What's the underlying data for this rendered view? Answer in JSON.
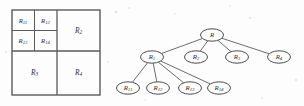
{
  "figure": {
    "background_color": "#fdfdfd",
    "line_color": "#5a5a5a",
    "text_color": "#2e2e2e"
  },
  "partition_diagram": {
    "name": "rectangle-partition",
    "outer": {
      "x": 12,
      "y": 10,
      "w": 88,
      "h": 85
    },
    "split_x": 57,
    "split_y": 51,
    "sub_split_x": 34.5,
    "sub_split_y": 30.5,
    "regions": [
      {
        "id": "R11",
        "base": "R",
        "sub": "11",
        "cx": 23,
        "cy": 20.5
      },
      {
        "id": "R12",
        "base": "R",
        "sub": "12",
        "cx": 45.5,
        "cy": 20.5
      },
      {
        "id": "R13",
        "base": "R",
        "sub": "13",
        "cx": 23,
        "cy": 41
      },
      {
        "id": "R14",
        "base": "R",
        "sub": "14",
        "cx": 45.5,
        "cy": 41
      },
      {
        "id": "R2",
        "base": "R",
        "sub": "2",
        "cx": 78.5,
        "cy": 30.5
      },
      {
        "id": "R3",
        "base": "R",
        "sub": "3",
        "cx": 34.5,
        "cy": 73
      },
      {
        "id": "R4",
        "base": "R",
        "sub": "4",
        "cx": 78.5,
        "cy": 73
      }
    ]
  },
  "tree_diagram": {
    "name": "partition-tree",
    "node_rx": 11.5,
    "node_ry": 6.2,
    "nodes": [
      {
        "id": "R",
        "base": "R",
        "sub": "",
        "cx": 212,
        "cy": 35,
        "level": 0
      },
      {
        "id": "R1",
        "base": "R",
        "sub": "1",
        "cx": 152,
        "cy": 57,
        "level": 1
      },
      {
        "id": "R2",
        "base": "R",
        "sub": "2",
        "cx": 196,
        "cy": 57,
        "level": 1
      },
      {
        "id": "R3",
        "base": "R",
        "sub": "3",
        "cx": 237,
        "cy": 57,
        "level": 1
      },
      {
        "id": "R4",
        "base": "R",
        "sub": "4",
        "cx": 279,
        "cy": 57,
        "level": 1
      },
      {
        "id": "R11",
        "base": "R",
        "sub": "11",
        "cx": 128,
        "cy": 88,
        "level": 2
      },
      {
        "id": "R12",
        "base": "R",
        "sub": "12",
        "cx": 158,
        "cy": 88,
        "level": 2
      },
      {
        "id": "R13",
        "base": "R",
        "sub": "13",
        "cx": 190,
        "cy": 88,
        "level": 2
      },
      {
        "id": "R14",
        "base": "R",
        "sub": "14",
        "cx": 219,
        "cy": 88,
        "level": 2
      }
    ],
    "edges": [
      {
        "from": "R",
        "to": "R1"
      },
      {
        "from": "R",
        "to": "R2"
      },
      {
        "from": "R",
        "to": "R3"
      },
      {
        "from": "R",
        "to": "R4"
      },
      {
        "from": "R1",
        "to": "R11"
      },
      {
        "from": "R1",
        "to": "R12"
      },
      {
        "from": "R1",
        "to": "R13"
      },
      {
        "from": "R1",
        "to": "R14"
      }
    ]
  }
}
